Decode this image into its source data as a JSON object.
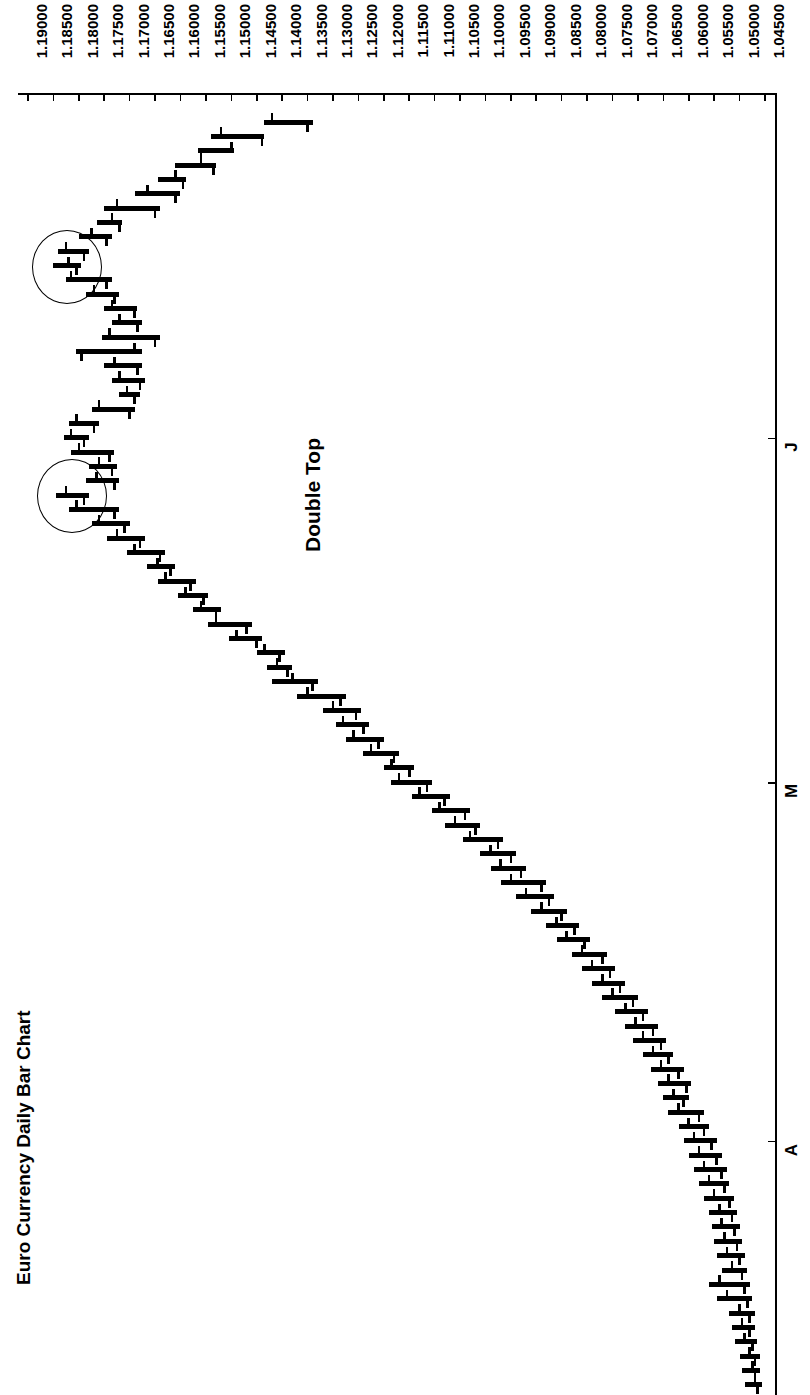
{
  "chart_data": {
    "type": "ohlc-bar",
    "title": "Euro Currency Daily Bar Chart",
    "orientation": "rotated-90-clockwise",
    "xlabel": "",
    "ylabel": "",
    "grid": false,
    "legend": null,
    "price_axis": {
      "name": "price",
      "min": 1.045,
      "max": 1.19,
      "step": 0.005,
      "tick_labels": [
        "1.19000",
        "1.18500",
        "1.18000",
        "1.17500",
        "1.17000",
        "1.16500",
        "1.16000",
        "1.15500",
        "1.15000",
        "1.14500",
        "1.14000",
        "1.13500",
        "1.13000",
        "1.12500",
        "1.12000",
        "1.11500",
        "1.11000",
        "1.10500",
        "1.10000",
        "1.09500",
        "1.09000",
        "1.08500",
        "1.08000",
        "1.07500",
        "1.07000",
        "1.06500",
        "1.06000",
        "1.05500",
        "1.05000",
        "1.04500"
      ]
    },
    "time_axis": {
      "name": "month",
      "tick_labels": [
        "J",
        "M",
        "A"
      ],
      "tick_positions_bar_index": [
        22,
        46,
        71
      ]
    },
    "annotations": [
      {
        "name": "double-top-label",
        "text": "Double Top",
        "bar_index": 26,
        "price": 1.136
      },
      {
        "name": "double-top-peak-1",
        "type": "circle",
        "bar_index": 10,
        "price": 1.1825
      },
      {
        "name": "double-top-peak-2",
        "type": "circle",
        "bar_index": 26,
        "price": 1.1815
      }
    ],
    "series": [
      {
        "name": "EUR/USD daily OHLC",
        "fields": [
          "open",
          "high",
          "low",
          "close"
        ],
        "bars": [
          [
            1.142,
            1.1435,
            1.134,
            1.135
          ],
          [
            1.152,
            1.154,
            1.1435,
            1.144
          ],
          [
            1.15,
            1.1565,
            1.1495,
            1.156
          ],
          [
            1.156,
            1.161,
            1.153,
            1.1535
          ],
          [
            1.161,
            1.1645,
            1.159,
            1.1595
          ],
          [
            1.1665,
            1.169,
            1.16,
            1.161
          ],
          [
            1.1725,
            1.175,
            1.164,
            1.165
          ],
          [
            1.1735,
            1.1765,
            1.1715,
            1.172
          ],
          [
            1.1775,
            1.18,
            1.1735,
            1.1745
          ],
          [
            1.1825,
            1.184,
            1.178,
            1.179
          ],
          [
            1.182,
            1.185,
            1.1795,
            1.1805
          ],
          [
            1.1815,
            1.1825,
            1.1735,
            1.1745
          ],
          [
            1.177,
            1.1785,
            1.172,
            1.173
          ],
          [
            1.1735,
            1.175,
            1.1685,
            1.169
          ],
          [
            1.172,
            1.1735,
            1.1675,
            1.1685
          ],
          [
            1.174,
            1.1755,
            1.164,
            1.165
          ],
          [
            1.169,
            1.1805,
            1.1675,
            1.1795
          ],
          [
            1.173,
            1.175,
            1.1675,
            1.1685
          ],
          [
            1.172,
            1.1735,
            1.167,
            1.168
          ],
          [
            1.1705,
            1.172,
            1.168,
            1.169
          ],
          [
            1.176,
            1.1775,
            1.169,
            1.17
          ],
          [
            1.1805,
            1.182,
            1.176,
            1.177
          ],
          [
            1.1815,
            1.183,
            1.178,
            1.179
          ],
          [
            1.18,
            1.1815,
            1.173,
            1.174
          ],
          [
            1.176,
            1.178,
            1.1725,
            1.1735
          ],
          [
            1.1765,
            1.1785,
            1.172,
            1.173
          ],
          [
            1.1825,
            1.1845,
            1.178,
            1.179
          ],
          [
            1.1805,
            1.182,
            1.172,
            1.173
          ],
          [
            1.176,
            1.1775,
            1.17,
            1.171
          ],
          [
            1.1725,
            1.1745,
            1.167,
            1.168
          ],
          [
            1.169,
            1.1705,
            1.163,
            1.164
          ],
          [
            1.1645,
            1.1665,
            1.161,
            1.162
          ],
          [
            1.163,
            1.1645,
            1.157,
            1.158
          ],
          [
            1.159,
            1.1605,
            1.1545,
            1.1555
          ],
          [
            1.156,
            1.1575,
            1.152,
            1.153
          ],
          [
            1.153,
            1.1545,
            1.146,
            1.147
          ],
          [
            1.149,
            1.1505,
            1.144,
            1.145
          ],
          [
            1.1435,
            1.145,
            1.1395,
            1.1405
          ],
          [
            1.141,
            1.143,
            1.138,
            1.139
          ],
          [
            1.138,
            1.142,
            1.133,
            1.134
          ],
          [
            1.135,
            1.137,
            1.1275,
            1.1285
          ],
          [
            1.13,
            1.132,
            1.1245,
            1.1255
          ],
          [
            1.128,
            1.1295,
            1.123,
            1.124
          ],
          [
            1.126,
            1.1275,
            1.12,
            1.121
          ],
          [
            1.1225,
            1.124,
            1.117,
            1.118
          ],
          [
            1.1185,
            1.12,
            1.114,
            1.115
          ],
          [
            1.117,
            1.1185,
            1.1105,
            1.1115
          ],
          [
            1.113,
            1.1145,
            1.107,
            1.108
          ],
          [
            1.109,
            1.1105,
            1.103,
            1.104
          ],
          [
            1.106,
            1.108,
            1.101,
            1.102
          ],
          [
            1.103,
            1.1045,
            1.0965,
            1.0975
          ],
          [
            1.099,
            1.101,
            1.094,
            1.095
          ],
          [
            1.097,
            1.099,
            1.092,
            1.093
          ],
          [
            1.095,
            1.097,
            1.088,
            1.089
          ],
          [
            1.092,
            1.094,
            1.0865,
            1.0875
          ],
          [
            1.089,
            1.091,
            1.084,
            1.085
          ],
          [
            1.086,
            1.088,
            1.0815,
            1.0825
          ],
          [
            1.084,
            1.086,
            1.0795,
            1.0805
          ],
          [
            1.081,
            1.083,
            1.076,
            1.077
          ],
          [
            1.079,
            1.081,
            1.0745,
            1.0755
          ],
          [
            1.077,
            1.079,
            1.0725,
            1.0735
          ],
          [
            1.075,
            1.077,
            1.07,
            1.071
          ],
          [
            1.0725,
            1.0745,
            1.068,
            1.069
          ],
          [
            1.0705,
            1.0725,
            1.066,
            1.067
          ],
          [
            1.069,
            1.071,
            1.0645,
            1.0655
          ],
          [
            1.067,
            1.069,
            1.063,
            1.064
          ],
          [
            1.0655,
            1.0675,
            1.061,
            1.062
          ],
          [
            1.064,
            1.066,
            1.0595,
            1.0605
          ],
          [
            1.063,
            1.065,
            1.06,
            1.061
          ],
          [
            1.062,
            1.064,
            1.057,
            1.058
          ],
          [
            1.06,
            1.062,
            1.056,
            1.057
          ],
          [
            1.059,
            1.061,
            1.0545,
            1.0555
          ],
          [
            1.058,
            1.06,
            1.0535,
            1.0545
          ],
          [
            1.057,
            1.059,
            1.0525,
            1.0535
          ],
          [
            1.056,
            1.058,
            1.052,
            1.053
          ],
          [
            1.055,
            1.057,
            1.051,
            1.052
          ],
          [
            1.054,
            1.056,
            1.0505,
            1.0515
          ],
          [
            1.0535,
            1.0555,
            1.05,
            1.051
          ],
          [
            1.053,
            1.055,
            1.0495,
            1.0505
          ],
          [
            1.0525,
            1.0545,
            1.049,
            1.05
          ],
          [
            1.0515,
            1.0535,
            1.0485,
            1.0495
          ],
          [
            1.054,
            1.056,
            1.048,
            1.049
          ],
          [
            1.0525,
            1.0545,
            1.0475,
            1.0485
          ],
          [
            1.05,
            1.052,
            1.047,
            1.048
          ],
          [
            1.0495,
            1.0515,
            1.047,
            1.048
          ],
          [
            1.049,
            1.051,
            1.0465,
            1.0475
          ],
          [
            1.048,
            1.05,
            1.046,
            1.047
          ],
          [
            1.0475,
            1.0495,
            1.046,
            1.047
          ],
          [
            1.047,
            1.049,
            1.0455,
            1.0465
          ]
        ]
      }
    ]
  }
}
